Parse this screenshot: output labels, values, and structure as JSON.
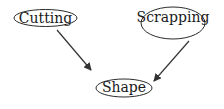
{
  "diagram": {
    "type": "directed-graph",
    "colors": {
      "stroke": "#2a2a2a",
      "text": "#1a1a1a",
      "edge": "#333333",
      "background": "#ffffff"
    },
    "nodes": [
      {
        "id": "cutting",
        "label": "Cutting",
        "cx": 45.5,
        "cy": 18,
        "rx": 31.5,
        "ry": 8.5
      },
      {
        "id": "scrapping",
        "label": "Scrapping",
        "cx": 173,
        "cy": 23,
        "rx": 32,
        "ry": 16
      },
      {
        "id": "shape",
        "label": "Shape",
        "cx": 124,
        "cy": 88,
        "rx": 28,
        "ry": 9
      }
    ],
    "edges": [
      {
        "from": "cutting",
        "to": "shape",
        "x1": 57,
        "y1": 30,
        "x2": 91,
        "y2": 70
      },
      {
        "from": "scrapping",
        "to": "shape",
        "x1": 189,
        "y1": 41,
        "x2": 154,
        "y2": 81
      }
    ]
  }
}
